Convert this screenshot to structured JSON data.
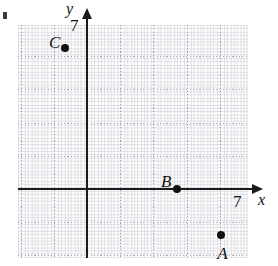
{
  "figure": {
    "background_color": "#ffffff",
    "ink_color": "#111111",
    "grid_color": "#8c8ca0"
  },
  "axes": {
    "x_label": "x",
    "y_label": "y",
    "x_tick_label": "7",
    "y_tick_label": "7",
    "x_range": [
      -2,
      8
    ],
    "y_range": [
      -2,
      8
    ],
    "grid": true,
    "major_grid_step": 1,
    "minor_ticks": true
  },
  "chart_data": {
    "type": "scatter",
    "title": "",
    "xlabel": "x",
    "ylabel": "y",
    "xlim": [
      -2.1,
      4.9
    ],
    "ylim": [
      -2.1,
      5.0
    ],
    "grid": true,
    "legend": "none",
    "points": [
      {
        "label": "C",
        "x": -0.66,
        "y": 4.25,
        "label_dx": -16,
        "label_dy": -14
      },
      {
        "label": "B",
        "x": 2.71,
        "y": 0.0,
        "label_dx": -16,
        "label_dy": -16
      },
      {
        "label": "A",
        "x": 4.04,
        "y": -1.39,
        "label_dx": -4,
        "label_dy": 10
      }
    ],
    "annotations": [
      {
        "text": "7",
        "role": "y-axis-tick"
      },
      {
        "text": "7",
        "role": "x-axis-tick"
      }
    ]
  }
}
